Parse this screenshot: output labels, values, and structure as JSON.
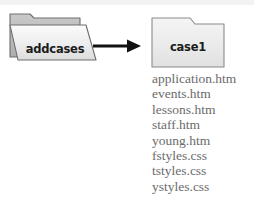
{
  "diagram": {
    "type": "folder-copy-diagram",
    "background_color": "#ffffff",
    "source_folder": {
      "label": "addcases",
      "style": "open-tabbed-folder",
      "fill_color": "#e8e8e8",
      "back_fill_color": "#b9b9b9",
      "outline_color": "#6e6e6e",
      "label_color": "#1b1b1b"
    },
    "arrow": {
      "name": "right-arrow",
      "direction": "right",
      "color": "#111111"
    },
    "destination_folder": {
      "label": "case1",
      "style": "closed-tabbed-folder",
      "fill_color": "#eeeeee",
      "outline_color": "#8a8a8a",
      "label_color": "#1b1b1b"
    },
    "file_list": {
      "text_color": "#6b6b6b",
      "files": [
        "application.htm",
        "events.htm",
        "lessons.htm",
        "staff.htm",
        "young.htm",
        "fstyles.css",
        "tstyles.css",
        "ystyles.css"
      ]
    }
  }
}
